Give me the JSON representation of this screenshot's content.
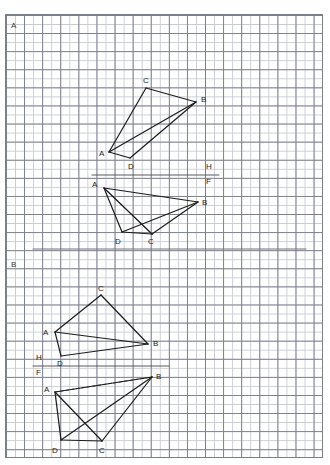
{
  "page": {
    "width": 330,
    "height": 465,
    "background": "#ffffff",
    "grid": {
      "minor_color": "#c9ccd4",
      "major_color": "#7b7f8c",
      "minor_step_px": 9.05,
      "major_step_px": 18.1,
      "left": 5,
      "top": 14,
      "width": 318,
      "height": 444
    },
    "ink_color": "#1c1c1c"
  },
  "sections": [
    {
      "name": "section-a",
      "label": "A",
      "label_x": 11,
      "label_y": 22
    },
    {
      "name": "section-b",
      "label": "B",
      "label_x": 11,
      "label_y": 261
    }
  ],
  "separator": {
    "x1": 33,
    "y1": 249,
    "x2": 306,
    "y2": 249,
    "color": "#6e727c"
  },
  "ground_lines": [
    {
      "name": "ground-line-a",
      "x1": 92,
      "y1": 175,
      "x2": 219,
      "y2": 175,
      "h_label": "H",
      "h_x": 206,
      "h_y": 163,
      "f_label": "F",
      "f_x": 206,
      "f_y": 178
    },
    {
      "name": "ground-line-b",
      "x1": 33,
      "y1": 366,
      "x2": 169,
      "y2": 366,
      "h_label": "H",
      "h_x": 36,
      "h_y": 354,
      "f_label": "F",
      "f_x": 36,
      "f_y": 369
    }
  ],
  "figures": [
    {
      "name": "figure-a-top",
      "vertices": {
        "A": {
          "x": 109,
          "y": 152
        },
        "B": {
          "x": 196,
          "y": 102
        },
        "C": {
          "x": 146,
          "y": 88
        },
        "D": {
          "x": 130,
          "y": 158
        }
      },
      "labels": [
        {
          "text": "A",
          "x": 99,
          "y": 150
        },
        {
          "text": "B",
          "x": 201,
          "y": 96
        },
        {
          "text": "C",
          "x": 143,
          "y": 77
        },
        {
          "text": "D",
          "x": 128,
          "y": 163
        }
      ],
      "solid_edges": [
        [
          "A",
          "C"
        ],
        [
          "C",
          "B"
        ],
        [
          "B",
          "A"
        ],
        [
          "A",
          "D"
        ],
        [
          "D",
          "B"
        ]
      ],
      "dashed_edges": []
    },
    {
      "name": "figure-a-bottom",
      "vertices": {
        "A": {
          "x": 104,
          "y": 188
        },
        "B": {
          "x": 198,
          "y": 202
        },
        "C": {
          "x": 152,
          "y": 234
        },
        "D": {
          "x": 122,
          "y": 232
        }
      },
      "labels": [
        {
          "text": "A",
          "x": 92,
          "y": 181
        },
        {
          "text": "B",
          "x": 202,
          "y": 199
        },
        {
          "text": "C",
          "x": 148,
          "y": 238
        },
        {
          "text": "D",
          "x": 115,
          "y": 238
        }
      ],
      "solid_edges": [
        [
          "A",
          "B"
        ],
        [
          "A",
          "D"
        ],
        [
          "D",
          "C"
        ],
        [
          "C",
          "B"
        ],
        [
          "A",
          "C"
        ],
        [
          "D",
          "B"
        ]
      ],
      "dashed_edges": [
        [
          "A",
          "C"
        ]
      ]
    },
    {
      "name": "figure-b-top",
      "vertices": {
        "A": {
          "x": 55,
          "y": 332
        },
        "B": {
          "x": 148,
          "y": 344
        },
        "C": {
          "x": 101,
          "y": 295
        },
        "D": {
          "x": 61,
          "y": 356
        }
      },
      "labels": [
        {
          "text": "A",
          "x": 43,
          "y": 329
        },
        {
          "text": "B",
          "x": 153,
          "y": 340
        },
        {
          "text": "C",
          "x": 98,
          "y": 285
        },
        {
          "text": "D",
          "x": 57,
          "y": 360
        }
      ],
      "solid_edges": [
        [
          "A",
          "C"
        ],
        [
          "C",
          "B"
        ],
        [
          "B",
          "A"
        ],
        [
          "A",
          "D"
        ],
        [
          "D",
          "B"
        ]
      ],
      "dashed_edges": []
    },
    {
      "name": "figure-b-bottom",
      "vertices": {
        "A": {
          "x": 55,
          "y": 392
        },
        "B": {
          "x": 152,
          "y": 377
        },
        "C": {
          "x": 102,
          "y": 441
        },
        "D": {
          "x": 61,
          "y": 440
        }
      },
      "labels": [
        {
          "text": "A",
          "x": 44,
          "y": 386
        },
        {
          "text": "B",
          "x": 156,
          "y": 373
        },
        {
          "text": "C",
          "x": 99,
          "y": 447
        },
        {
          "text": "D",
          "x": 52,
          "y": 447
        }
      ],
      "solid_edges": [
        [
          "A",
          "B"
        ],
        [
          "A",
          "D"
        ],
        [
          "D",
          "C"
        ],
        [
          "C",
          "B"
        ],
        [
          "A",
          "C"
        ],
        [
          "D",
          "B"
        ]
      ],
      "dashed_edges": [
        [
          "A",
          "B"
        ]
      ]
    }
  ]
}
